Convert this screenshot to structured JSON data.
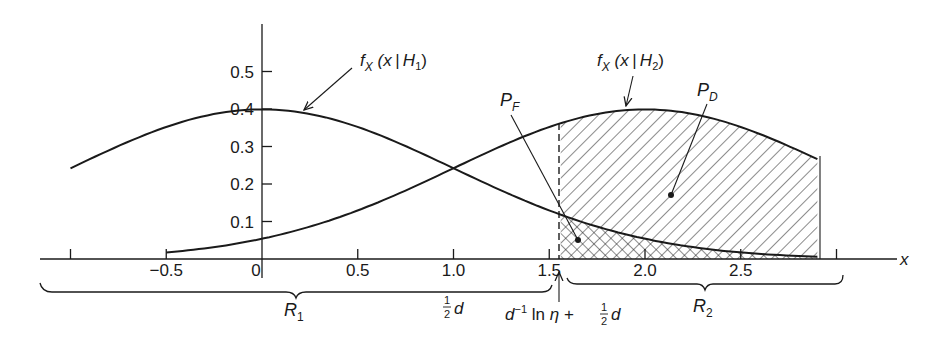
{
  "chart_data": {
    "type": "area",
    "title": "",
    "xlabel": "x",
    "ylabel": "",
    "xlim": [
      -1.0,
      3.0
    ],
    "ylim": [
      0,
      0.55
    ],
    "grid": false,
    "x_ticks": [
      -1.0,
      -0.5,
      0,
      0.5,
      1.0,
      1.5,
      2.0,
      2.5,
      3.0
    ],
    "x_tick_labels": [
      "",
      "−0.5",
      "0",
      "0.5",
      "1.0",
      "1.5",
      "2.0",
      "2.5",
      ""
    ],
    "y_ticks": [
      0.1,
      0.2,
      0.3,
      0.4,
      0.5
    ],
    "y_tick_labels": [
      "0.1",
      "0.2",
      "0.3",
      "0.4",
      "0.5"
    ],
    "series": [
      {
        "name": "f_X(x|H_1)",
        "distribution": "Gaussian",
        "mean": 0,
        "std": 1,
        "x_range": [
          -1.0,
          2.9
        ],
        "x": [
          -1.0,
          -0.5,
          0,
          0.5,
          1.0,
          1.5,
          2.0,
          2.5,
          2.9
        ],
        "values": [
          0.242,
          0.352,
          0.399,
          0.352,
          0.242,
          0.13,
          0.054,
          0.018,
          0.006
        ]
      },
      {
        "name": "f_X(x|H_2)",
        "distribution": "Gaussian",
        "mean": 2,
        "std": 1,
        "x_range": [
          -0.5,
          2.9
        ],
        "x": [
          -0.5,
          0,
          0.5,
          1.0,
          1.5,
          2.0,
          2.5,
          2.9
        ],
        "values": [
          0.018,
          0.054,
          0.13,
          0.242,
          0.352,
          0.399,
          0.352,
          0.266
        ]
      }
    ],
    "threshold": 1.56,
    "shaded_regions": [
      {
        "name": "P_D",
        "pattern": "diagonal hatch",
        "under": "f_X(x|H_2)",
        "x_range": [
          1.56,
          2.9
        ]
      },
      {
        "name": "P_F",
        "pattern": "cross hatch",
        "under": "f_X(x|H_1)",
        "x_range": [
          1.56,
          2.9
        ]
      }
    ],
    "decision_regions": [
      {
        "name": "R_1",
        "x_range": [
          -1.1,
          1.56
        ]
      },
      {
        "name": "R_2",
        "x_range": [
          1.56,
          3.05
        ]
      }
    ],
    "annotations": [
      "f_X(x|H_1)",
      "f_X(x|H_2)",
      "P_F",
      "P_D",
      "R_1",
      "R_2",
      "(1/2)d",
      "d^-1 ln η + (1/2)d"
    ]
  },
  "labels": {
    "curve1": {
      "f": "f",
      "sub": "X",
      "arg": " (x | H",
      "idx": "1",
      "close": ")"
    },
    "curve2": {
      "f": "f",
      "sub": "X",
      "arg": " (x | H",
      "idx": "2",
      "close": ")"
    },
    "pf": {
      "main": "P",
      "sub": "F"
    },
    "pd": {
      "main": "P",
      "sub": "D"
    },
    "r1": {
      "main": "R",
      "sub": "1"
    },
    "r2": {
      "main": "R",
      "sub": "2"
    },
    "half_d": {
      "num": "1",
      "den": "2",
      "var": "d"
    },
    "threshold": {
      "d": "d",
      "exp": "−1",
      "ln": " ln ",
      "eta": "η",
      "plus": " + ",
      "num": "1",
      "den": "2",
      "var": "d"
    },
    "x_axis": "x"
  }
}
